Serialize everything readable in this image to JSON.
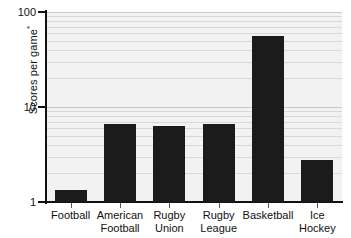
{
  "chart_data": {
    "type": "bar",
    "title": "",
    "xlabel": "",
    "ylabel": "Scores per game*",
    "ylabel_text": "Scores per game",
    "ylabel_superscript": "*",
    "yscale": "log",
    "ylim": [
      1,
      100
    ],
    "ytick_labels": [
      "100",
      "10",
      "1"
    ],
    "ytick_values": [
      100,
      10,
      1
    ],
    "grid": true,
    "grid_orientation": "horizontal",
    "legend": "none",
    "categories": [
      "Football",
      "American\nFootball",
      "Rugby\nUnion",
      "Rugby\nLeague",
      "Basketball",
      "Ice\nHockey"
    ],
    "values": [
      1.35,
      6.6,
      6.3,
      6.6,
      56,
      2.8
    ],
    "bars": [
      {
        "label": "Football",
        "value": 1.35
      },
      {
        "label": "American\nFootball",
        "value": 6.6
      },
      {
        "label": "Rugby\nUnion",
        "value": 6.3
      },
      {
        "label": "Rugby\nLeague",
        "value": 6.6
      },
      {
        "label": "Basketball",
        "value": 56
      },
      {
        "label": "Ice\nHockey",
        "value": 2.8
      }
    ],
    "colors": {
      "bar": "#1b1b1b",
      "plot_background": "#f2f2f2",
      "page_background": "#ffffff",
      "gridline": "#d8d8d8",
      "axis": "#111111",
      "text": "#111111"
    }
  }
}
